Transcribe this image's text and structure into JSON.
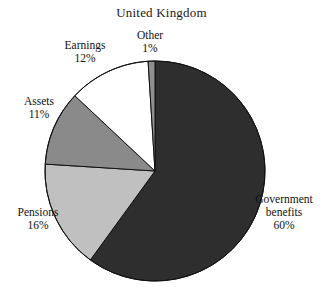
{
  "chart_data": {
    "type": "pie",
    "title": "United Kingdom",
    "xlabel": "",
    "ylabel": "",
    "legend": "none",
    "grid": false,
    "units": "percent",
    "start_angle_deg": 0,
    "direction": "clockwise",
    "categories": [
      "Government benefits",
      "Pensions",
      "Assets",
      "Earnings",
      "Other"
    ],
    "values": [
      60,
      16,
      11,
      12,
      1
    ],
    "slices": [
      {
        "name": "Government benefits",
        "label_line1": "Government",
        "label_line2": "benefits",
        "value": 60,
        "value_label": "60%",
        "color": "#2e2e2e",
        "start_deg": 0,
        "end_deg": 216
      },
      {
        "name": "Pensions",
        "label_line1": "Pensions",
        "label_line2": "",
        "value": 16,
        "value_label": "16%",
        "color": "#c0c0c0",
        "start_deg": 216,
        "end_deg": 273.6
      },
      {
        "name": "Assets",
        "label_line1": "Assets",
        "label_line2": "",
        "value": 11,
        "value_label": "11%",
        "color": "#8a8a8a",
        "start_deg": 273.6,
        "end_deg": 313.2
      },
      {
        "name": "Earnings",
        "label_line1": "Earnings",
        "label_line2": "",
        "value": 12,
        "value_label": "12%",
        "color": "#ffffff",
        "start_deg": 313.2,
        "end_deg": 356.4
      },
      {
        "name": "Other",
        "label_line1": "Other",
        "label_line2": "",
        "value": 1,
        "value_label": "1%",
        "color": "#8f8f8f",
        "start_deg": 356.4,
        "end_deg": 360
      }
    ]
  },
  "style": {
    "background": "#ffffff",
    "outline": "#111111",
    "text": "#111111"
  }
}
